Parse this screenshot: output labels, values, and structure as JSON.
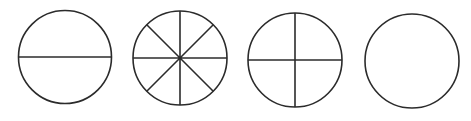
{
  "diagram": {
    "title": "",
    "stroke_color": "#2b2b2b",
    "background": "#ffffff",
    "circles": [
      {
        "id": "halves",
        "cx": 65,
        "cy": 57,
        "r": 46.5,
        "divisions": 2
      },
      {
        "id": "eighths",
        "cx": 180,
        "cy": 58,
        "r": 47,
        "divisions": 8
      },
      {
        "id": "quarters",
        "cx": 295,
        "cy": 60,
        "r": 47,
        "divisions": 4
      },
      {
        "id": "whole",
        "cx": 412,
        "cy": 61,
        "r": 47,
        "divisions": 1
      }
    ]
  }
}
